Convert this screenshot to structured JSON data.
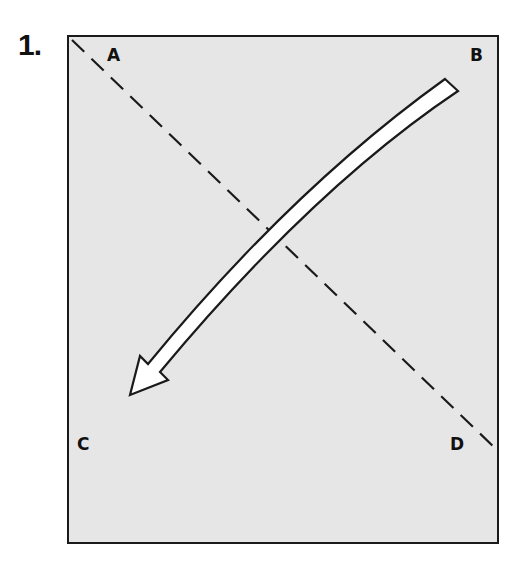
{
  "figure": {
    "step_number": "1.",
    "panel_fill": "#e6e6e6",
    "stroke_color": "#1a1a1a",
    "arrow_fill": "#ffffff",
    "labels": {
      "a": "A",
      "b": "B",
      "c": "C",
      "d": "D"
    },
    "dashed_line": {
      "from_label": "A",
      "to_label": "D",
      "style": "dashed"
    },
    "arrow": {
      "from_label": "B",
      "to_label": "C",
      "style": "curved white arrow with black outline"
    }
  }
}
